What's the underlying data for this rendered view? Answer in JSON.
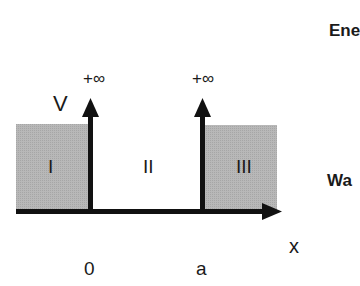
{
  "diagram": {
    "axis": {
      "vertical_label": "V",
      "horizontal_label": "x",
      "ticks": [
        "0",
        "a"
      ]
    },
    "walls": [
      {
        "label": "+∞",
        "position": "0"
      },
      {
        "label": "+∞",
        "position": "a"
      }
    ],
    "regions": [
      {
        "label": "I",
        "shaded": true
      },
      {
        "label": "II",
        "shaded": false
      },
      {
        "label": "III",
        "shaded": true
      }
    ],
    "colors": {
      "shade": "#b4b4b4",
      "line": "#111111"
    }
  },
  "side_text": {
    "top": "Ene",
    "middle": "Wa"
  }
}
